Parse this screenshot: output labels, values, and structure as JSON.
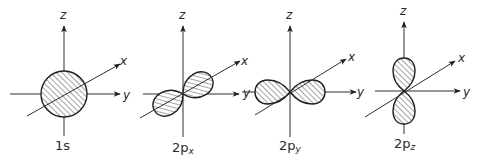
{
  "figure": {
    "colors": {
      "line": "#2f2f2f",
      "hatch": "#4a4a4a",
      "background": "#ffffff"
    },
    "panels": [
      {
        "id": "1s",
        "label_main": "1s",
        "label_sub": "",
        "shape": "sphere",
        "axes": {
          "z": "z",
          "x": "x",
          "y": "y"
        }
      },
      {
        "id": "2px",
        "label_main": "2p",
        "label_sub": "x",
        "shape": "dumbbell-along-x",
        "axes": {
          "z": "z",
          "x": "x",
          "y": "y"
        }
      },
      {
        "id": "2py",
        "label_main": "2p",
        "label_sub": "y",
        "shape": "dumbbell-along-y",
        "axes": {
          "z": "z",
          "x": "x",
          "y": "y"
        }
      },
      {
        "id": "2pz",
        "label_main": "2p",
        "label_sub": "z",
        "shape": "dumbbell-along-z",
        "axes": {
          "z": "z",
          "x": "x",
          "y": "y"
        }
      }
    ]
  }
}
